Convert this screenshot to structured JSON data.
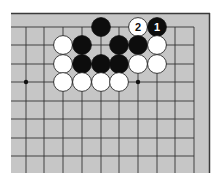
{
  "board": {
    "background": "#c6c6c6",
    "line_color": "#333333",
    "edge_color": "#3a3a3a",
    "columns_x": [
      26,
      44,
      63,
      82,
      101,
      119,
      138,
      157,
      175,
      194
    ],
    "rows_y": [
      27,
      45,
      64,
      82,
      101,
      119,
      138,
      156
    ],
    "star_points": [
      {
        "col": 0,
        "row": 3
      },
      {
        "col": 6,
        "row": 3
      }
    ],
    "stones": [
      {
        "color": "black",
        "col": 4,
        "row": 0
      },
      {
        "color": "white",
        "col": 6,
        "row": 0,
        "label": "2"
      },
      {
        "color": "black",
        "col": 7,
        "row": 0,
        "label": "1"
      },
      {
        "color": "white",
        "col": 2,
        "row": 1
      },
      {
        "color": "black",
        "col": 3,
        "row": 1
      },
      {
        "color": "black",
        "col": 5,
        "row": 1
      },
      {
        "color": "black",
        "col": 6,
        "row": 1
      },
      {
        "color": "white",
        "col": 7,
        "row": 1
      },
      {
        "color": "white",
        "col": 2,
        "row": 2
      },
      {
        "color": "black",
        "col": 3,
        "row": 2
      },
      {
        "color": "black",
        "col": 4,
        "row": 2
      },
      {
        "color": "black",
        "col": 5,
        "row": 2
      },
      {
        "color": "white",
        "col": 6,
        "row": 2
      },
      {
        "color": "white",
        "col": 7,
        "row": 2
      },
      {
        "color": "white",
        "col": 2,
        "row": 3
      },
      {
        "color": "white",
        "col": 3,
        "row": 3
      },
      {
        "color": "white",
        "col": 4,
        "row": 3
      },
      {
        "color": "white",
        "col": 5,
        "row": 3
      }
    ]
  }
}
